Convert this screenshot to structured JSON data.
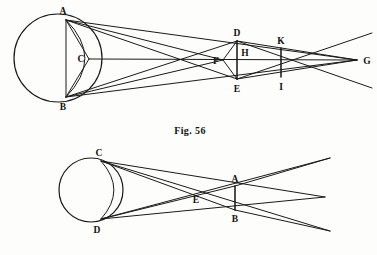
{
  "page": {
    "background_color": "#fdfdfb",
    "ink_color": "#1a1a1a",
    "width": 377,
    "height": 255
  },
  "captions": {
    "fig56": "Fig. 56"
  },
  "figures": [
    {
      "id": "fig-56",
      "caption": "Fig. 56",
      "caption_x": 190,
      "caption_y": 131,
      "circle": {
        "cx": 58,
        "cy": 58,
        "r": 44
      },
      "points": [
        {
          "name": "A",
          "x": 66,
          "y": 20,
          "label_x": 63,
          "label_y": 14
        },
        {
          "name": "B",
          "x": 66,
          "y": 97,
          "label_x": 63,
          "label_y": 108
        },
        {
          "name": "C",
          "x": 89,
          "y": 59,
          "label_x": 82,
          "label_y": 57
        },
        {
          "name": "D",
          "x": 237,
          "y": 41,
          "label_x": 234,
          "label_y": 36
        },
        {
          "name": "E",
          "x": 237,
          "y": 79,
          "label_x": 234,
          "label_y": 90
        },
        {
          "name": "F",
          "x": 223,
          "y": 60,
          "label_x": 215,
          "label_y": 64
        },
        {
          "name": "H",
          "x": 243,
          "y": 60,
          "label_x": 240,
          "label_y": 56
        },
        {
          "name": "K",
          "x": 281,
          "y": 48,
          "label_x": 277,
          "label_y": 44
        },
        {
          "name": "I",
          "x": 281,
          "y": 77,
          "label_x": 278,
          "label_y": 88
        },
        {
          "name": "G",
          "x": 357,
          "y": 60,
          "label_x": 363,
          "label_y": 64
        }
      ]
    },
    {
      "id": "fig-lower",
      "caption": "",
      "circle": {
        "cx": 91,
        "cy": 190,
        "r": 32
      },
      "points": [
        {
          "name": "C",
          "x": 101,
          "y": 161,
          "label_x": 97,
          "label_y": 156
        },
        {
          "name": "D",
          "x": 101,
          "y": 219,
          "label_x": 96,
          "label_y": 231
        },
        {
          "name": "A",
          "x": 235,
          "y": 186,
          "label_x": 232,
          "label_y": 181
        },
        {
          "name": "B",
          "x": 235,
          "y": 210,
          "label_x": 232,
          "label_y": 221
        },
        {
          "name": "E",
          "x": 200,
          "y": 193,
          "label_x": 193,
          "label_y": 202
        }
      ]
    }
  ]
}
